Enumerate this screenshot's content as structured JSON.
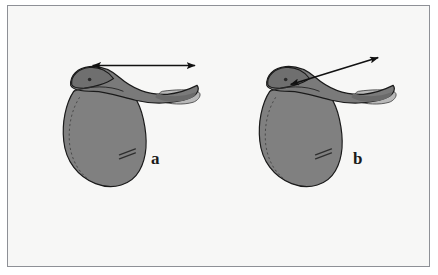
{
  "figure": {
    "background_color": "#f7f7f6",
    "page_color": "#ffffff",
    "border_color": "#8e9096",
    "labels": [
      {
        "id": "a",
        "text": "a"
      },
      {
        "id": "b",
        "text": "b"
      }
    ],
    "colors": {
      "saddle_body": "#808080",
      "saddle_body_dark": "#6f6f6f",
      "seat_shadow": "#6a6a6a",
      "panel_light": "#b9b9b9",
      "panel_mid": "#9a9a9a",
      "outline": "#1a1a1a",
      "stitch": "#4a4a4a",
      "arrow": "#111111"
    },
    "items": [
      {
        "id": "saddle-a",
        "label": "a",
        "arrow": {
          "name": "measurement-arrow-horizontal",
          "style": "double-headed",
          "orientation": "horizontal",
          "from": [
            90,
            65
          ],
          "to": [
            193,
            65
          ]
        }
      },
      {
        "id": "saddle-b",
        "label": "b",
        "arrow": {
          "name": "measurement-arrow-diagonal",
          "style": "double-headed",
          "orientation": "diagonal",
          "from": [
            289,
            84
          ],
          "to": [
            377,
            57
          ]
        }
      }
    ]
  }
}
